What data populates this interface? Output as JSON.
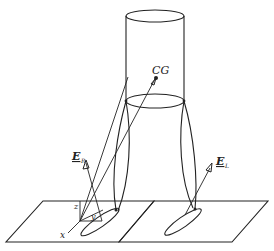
{
  "diagram": {
    "labels": {
      "cg": "CG",
      "e_r_main": "E",
      "e_r_sub": "R",
      "e_l_main": "E",
      "e_l_sub": "L",
      "axis_x": "x",
      "axis_y": "y",
      "axis_z": "z"
    },
    "components": [
      "body-cylinder",
      "right-leg",
      "left-leg",
      "right-foot",
      "left-foot",
      "ground-plate-right",
      "ground-plate-left",
      "coordinate-frame"
    ],
    "colors": {
      "stroke": "#222222",
      "background": "#ffffff"
    }
  }
}
